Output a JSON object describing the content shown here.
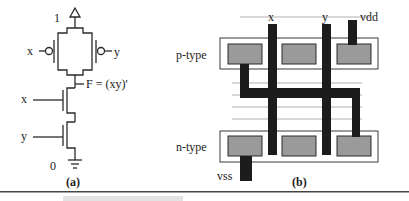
{
  "figure": {
    "panel_a": {
      "caption": "(a)",
      "supply_label": "1",
      "ground_label": "0",
      "output_label": "F = (xy)'",
      "pmos_left_input": "x",
      "pmos_right_input": "y",
      "nmos_top_input": "x",
      "nmos_bottom_input": "y",
      "icons": [
        "supply-triangle-icon",
        "ground-icon",
        "pmos-transistor-icon",
        "nmos-transistor-icon"
      ]
    },
    "panel_b": {
      "caption": "(b)",
      "ptype_label": "p-type",
      "ntype_label": "n-type",
      "poly_x_label": "x",
      "poly_y_label": "y",
      "vdd_label": "vdd",
      "vss_label": "vss"
    },
    "colors": {
      "wire": "#2a2a2a",
      "metal": "#1c1c1c",
      "diffusion_fill": "#9a9a9a",
      "well_outline": "#3a3a3a",
      "background": "#ffffff"
    }
  }
}
